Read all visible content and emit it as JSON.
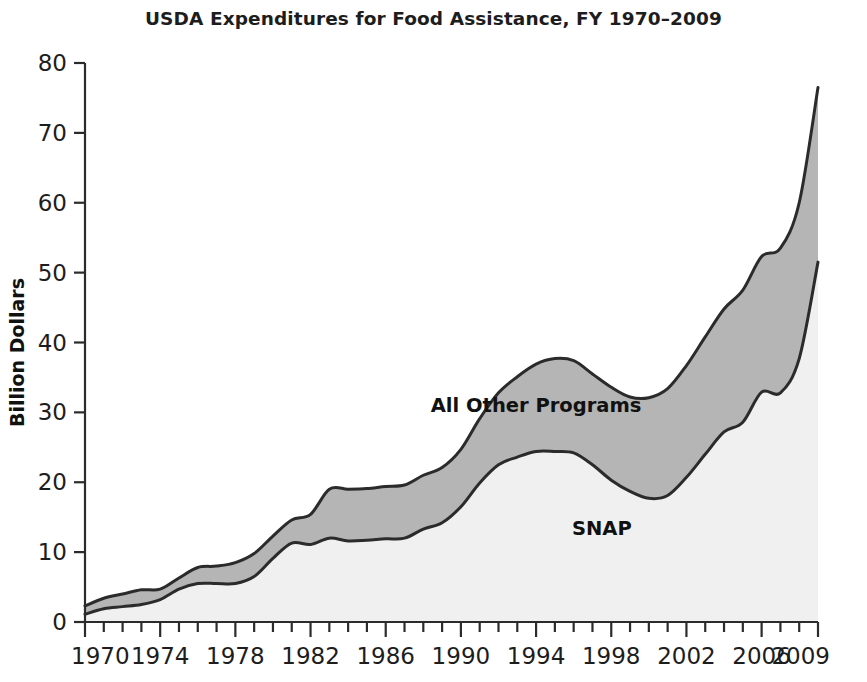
{
  "chart_data": {
    "type": "area",
    "title": "USDA Expenditures for Food Assistance, FY 1970–2009",
    "xlabel": "",
    "ylabel": "Billion Dollars",
    "stacked": true,
    "grid": false,
    "legend_position": "inline-annotations",
    "xlim": [
      1970,
      2009
    ],
    "ylim": [
      0,
      80
    ],
    "yticks": [
      0,
      10,
      20,
      30,
      40,
      50,
      60,
      70,
      80
    ],
    "ytick_labels": [
      "0",
      "10",
      "20",
      "30",
      "40",
      "50",
      "60",
      "70",
      "80"
    ],
    "xticks_labeled": [
      1970,
      1974,
      1978,
      1982,
      1986,
      1990,
      1994,
      1998,
      2002,
      2006,
      2009
    ],
    "xtick_labels": [
      "1970",
      "1974",
      "1978",
      "1982",
      "1986",
      "1990",
      "1994",
      "1998",
      "2002",
      "2006",
      "2009"
    ],
    "xtick_minor_step": 1,
    "x": [
      1970,
      1971,
      1972,
      1973,
      1974,
      1975,
      1976,
      1977,
      1978,
      1979,
      1980,
      1981,
      1982,
      1983,
      1984,
      1985,
      1986,
      1987,
      1988,
      1989,
      1990,
      1991,
      1992,
      1993,
      1994,
      1995,
      1996,
      1997,
      1998,
      1999,
      2000,
      2001,
      2002,
      2003,
      2004,
      2005,
      2006,
      2007,
      2008,
      2009
    ],
    "series": [
      {
        "name": "SNAP",
        "color": "#f0f0f0",
        "values": [
          1.1,
          1.9,
          2.2,
          2.5,
          3.2,
          4.7,
          5.5,
          5.5,
          5.5,
          6.5,
          9.1,
          11.3,
          11.1,
          12.0,
          11.6,
          11.7,
          11.9,
          12.0,
          13.3,
          14.2,
          16.5,
          19.9,
          22.5,
          23.6,
          24.4,
          24.4,
          24.2,
          22.5,
          20.3,
          18.7,
          17.7,
          18.1,
          20.7,
          24.0,
          27.2,
          28.6,
          32.9,
          32.8,
          37.7,
          51.5
        ]
      },
      {
        "name": "All Other Programs",
        "color": "#b5b5b5",
        "values": [
          1.2,
          1.5,
          1.8,
          2.1,
          1.5,
          1.6,
          2.3,
          2.5,
          3.0,
          3.3,
          3.2,
          3.3,
          4.3,
          7.0,
          7.4,
          7.4,
          7.5,
          7.6,
          7.7,
          7.9,
          8.2,
          9.2,
          10.3,
          11.5,
          12.5,
          13.3,
          13.2,
          13.0,
          13.3,
          13.5,
          14.4,
          15.3,
          16.0,
          16.8,
          17.6,
          18.9,
          19.4,
          20.7,
          22.3,
          25.0
        ]
      }
    ],
    "total_values": [
      2.3,
      3.4,
      4.0,
      4.6,
      4.7,
      6.3,
      7.8,
      8.0,
      8.5,
      9.8,
      12.3,
      14.6,
      15.4,
      19.0,
      19.0,
      19.1,
      19.4,
      19.6,
      21.0,
      22.1,
      24.7,
      29.1,
      32.8,
      35.1,
      36.9,
      37.7,
      37.4,
      35.5,
      33.6,
      32.2,
      32.1,
      33.4,
      36.7,
      40.8,
      44.8,
      47.5,
      52.3,
      53.5,
      60.0,
      76.5
    ],
    "annotations": [
      {
        "text": "All Other Programs",
        "x": 1994,
        "y": 30.0,
        "name": "all-other-programs-label"
      },
      {
        "text": "SNAP",
        "x": 1997.5,
        "y": 12.5,
        "name": "snap-label"
      }
    ],
    "style": {
      "line_color": "#2b2b2b",
      "axis_color": "#2b2b2b",
      "background": "#ffffff",
      "snap_fill": "#f0f0f0",
      "other_fill": "#b5b5b5"
    }
  }
}
